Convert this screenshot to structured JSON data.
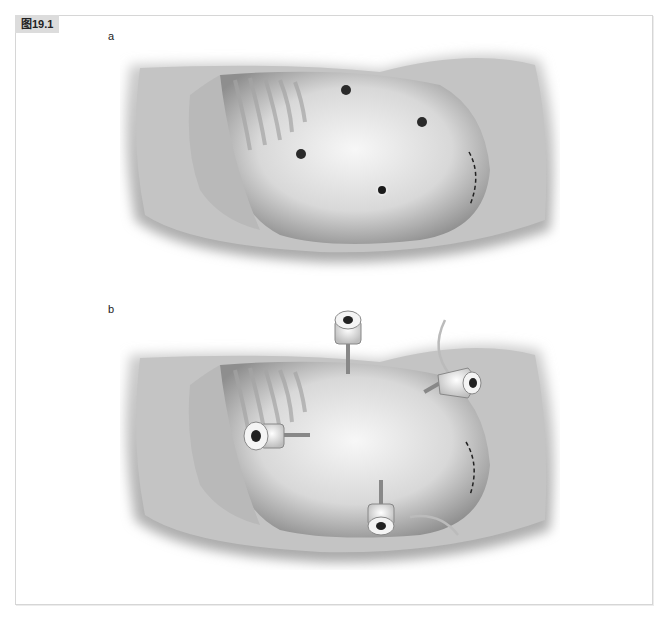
{
  "figure": {
    "label": "图19.1",
    "panels": [
      {
        "letter": "a",
        "description": "Illustration of patient's abdomen in lateral decubitus position with rib cage visible; four dark dots mark planned trocar sites (one near umbilicus) and a dashed curved line marks a planned incision on the right flank"
      },
      {
        "letter": "b",
        "description": "Same abdomen with four laparoscopic trocars inserted at the marked sites, two with attached insufflation/tubing lines; dashed incision line still shown on the right flank"
      }
    ],
    "colors": {
      "label_background": "#dcdcdc",
      "frame_border": "#d6d6d6",
      "skin_light": "#f2f2f2",
      "skin_shadow": "#8a8a8a",
      "mark_dot": "#2a2a2a"
    }
  }
}
